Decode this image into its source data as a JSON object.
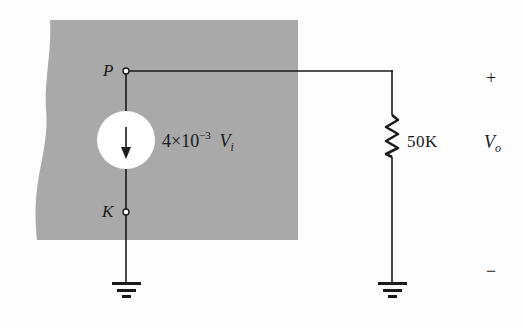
{
  "diagram": {
    "type": "circuit-equivalent",
    "colors": {
      "shaded_region": "#a9a9a9",
      "wire": "#1a1a1a",
      "source_fill": "#ffffff",
      "background": "#fdfdfd"
    },
    "nodes": {
      "p": {
        "label": "P"
      },
      "k": {
        "label": "K"
      }
    },
    "current_source": {
      "coefficient": "4×10",
      "exponent": "−3",
      "variable": "V",
      "variable_subscript": "i",
      "direction": "down"
    },
    "resistor": {
      "label": "50K"
    },
    "output": {
      "plus": "+",
      "minus": "−",
      "variable": "V",
      "variable_subscript": "o"
    },
    "grounds": [
      {
        "name": "source-ground"
      },
      {
        "name": "load-ground"
      }
    ]
  }
}
